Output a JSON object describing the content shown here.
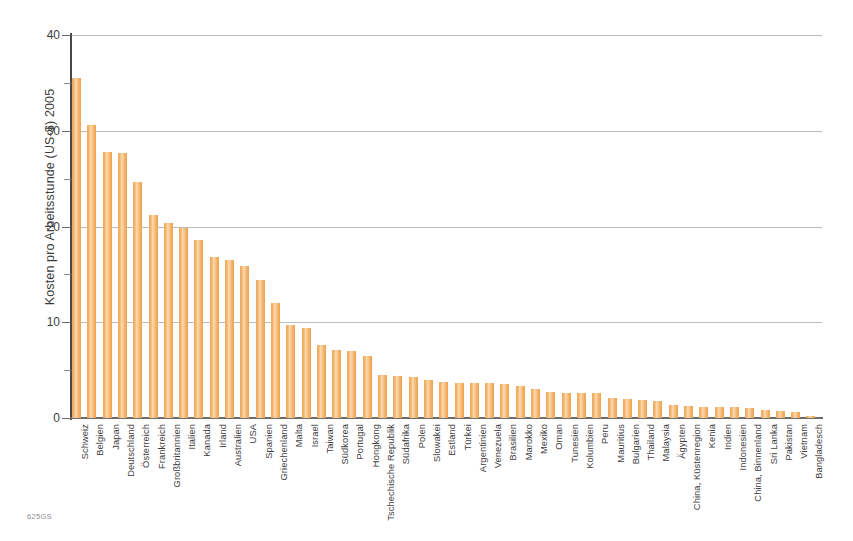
{
  "figure": {
    "source_code": "625GS"
  },
  "chart_data": {
    "type": "bar",
    "title": "",
    "subtitle": "",
    "xlabel": "",
    "ylabel": "Kosten pro Arbeitsstunde (US-$) 2005",
    "ylim": [
      0,
      40
    ],
    "ytick_values": [
      0,
      10,
      20,
      30,
      40
    ],
    "ytick_labels": [
      "0",
      "10",
      "20",
      "30",
      "40"
    ],
    "yminor_tick_values": [
      5,
      15,
      25,
      35
    ],
    "gridlines": true,
    "legend": "none",
    "orientation": "vertical",
    "bar_color": "#f2ae60",
    "categories": [
      "Schweiz",
      "Belgien",
      "Japan",
      "Deutschland",
      "Österreich",
      "Frankreich",
      "Großbritannien",
      "Italien",
      "Kanada",
      "Irland",
      "Australien",
      "USA",
      "Spanien",
      "Griechenland",
      "Malta",
      "Israel",
      "Taiwan",
      "Südkorea",
      "Portugal",
      "Hongkong",
      "Tschechische Republik",
      "Südafrika",
      "Polen",
      "Slowakei",
      "Estland",
      "Türkei",
      "Argentinien",
      "Venezuela",
      "Brasilien",
      "Marokko",
      "Mexiko",
      "Oman",
      "Tunesien",
      "Kolumbien",
      "Peru",
      "Mauritius",
      "Bulgarien",
      "Thailand",
      "Malaysia",
      "Ägypten",
      "China, Küstenregion",
      "Kenia",
      "Indien",
      "Indonesien",
      "China, Binnenland",
      "Sri Lanka",
      "Pakistan",
      "Vietnam",
      "Bangladesch"
    ],
    "values": [
      35.5,
      30.6,
      27.8,
      27.7,
      24.6,
      21.2,
      20.4,
      19.8,
      18.6,
      16.8,
      16.5,
      15.9,
      14.4,
      12.0,
      9.7,
      9.4,
      7.6,
      7.1,
      7.0,
      6.5,
      4.5,
      4.4,
      4.3,
      4.0,
      3.8,
      3.7,
      3.7,
      3.7,
      3.6,
      3.3,
      3.0,
      2.7,
      2.6,
      2.6,
      2.6,
      2.1,
      2.0,
      1.9,
      1.8,
      1.4,
      1.3,
      1.2,
      1.1,
      1.1,
      1.0,
      0.8,
      0.7,
      0.6,
      0.2
    ],
    "unit": "US-$"
  }
}
